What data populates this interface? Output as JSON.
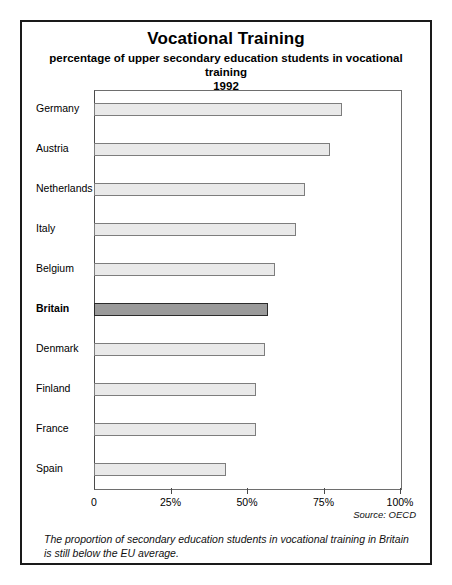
{
  "chart_data": {
    "type": "bar",
    "orientation": "horizontal",
    "title": "Vocational Training",
    "subtitle": "percentage of upper secondary education students in vocational training",
    "year_label": "1992",
    "xlabel": "",
    "ylabel": "",
    "xlim": [
      0,
      100
    ],
    "grid": false,
    "legend": null,
    "categories": [
      "Germany",
      "Austria",
      "Netherlands",
      "Italy",
      "Belgium",
      "Britain",
      "Denmark",
      "Finland",
      "France",
      "Spain"
    ],
    "values": [
      81,
      77,
      69,
      66,
      59,
      57,
      56,
      53,
      53,
      43
    ],
    "highlight_category": "Britain",
    "tick_values": [
      0,
      25,
      50,
      75,
      100
    ],
    "tick_labels": [
      "0",
      "25%",
      "50%",
      "75%",
      "100%"
    ],
    "source": "Source: OECD",
    "annotation": "The proportion of secondary education students in vocational training in Britain is still below the EU average.",
    "colors": {
      "bar_fill": "#e9e9e9",
      "bar_border": "#7d7d7d",
      "highlight_fill": "#9a9a9a",
      "highlight_border": "#2a2a2a",
      "frame": "#1a1a1a",
      "axis": "#4a4a4a",
      "text": "#111111",
      "background": "#ffffff"
    }
  }
}
